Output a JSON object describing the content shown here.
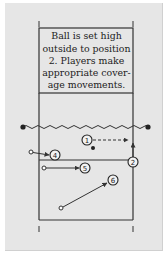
{
  "diagram": {
    "caption": "Ball is set high outside to position 2. Players make appropriate coverage movements.",
    "caption_lines": [
      "Ball is set high",
      "outside to position",
      "2. Players make",
      "appropriate cover-",
      "age movements."
    ],
    "colors": {
      "background": "#e6e6e6",
      "lines": "#333333",
      "net": "#333333"
    },
    "players": [
      {
        "label": "1",
        "x": 87,
        "y": 140
      },
      {
        "label": "2",
        "x": 133,
        "y": 162
      },
      {
        "label": "4",
        "x": 55,
        "y": 155
      },
      {
        "label": "5",
        "x": 85,
        "y": 168
      },
      {
        "label": "6",
        "x": 113,
        "y": 180
      }
    ],
    "ball": {
      "x": 93,
      "y": 148
    },
    "movements": [
      {
        "from_player": "1",
        "style": "dashed",
        "to": "right sideline near net"
      },
      {
        "from_player": "2",
        "style": "solid",
        "to": "toward net"
      },
      {
        "from_player": "4",
        "style": "solid",
        "origin": [
          31,
          152
        ]
      },
      {
        "from_player": "5",
        "style": "solid",
        "origin": [
          44,
          168
        ]
      },
      {
        "from_player": "6",
        "style": "solid",
        "origin": [
          61,
          208
        ]
      }
    ]
  }
}
